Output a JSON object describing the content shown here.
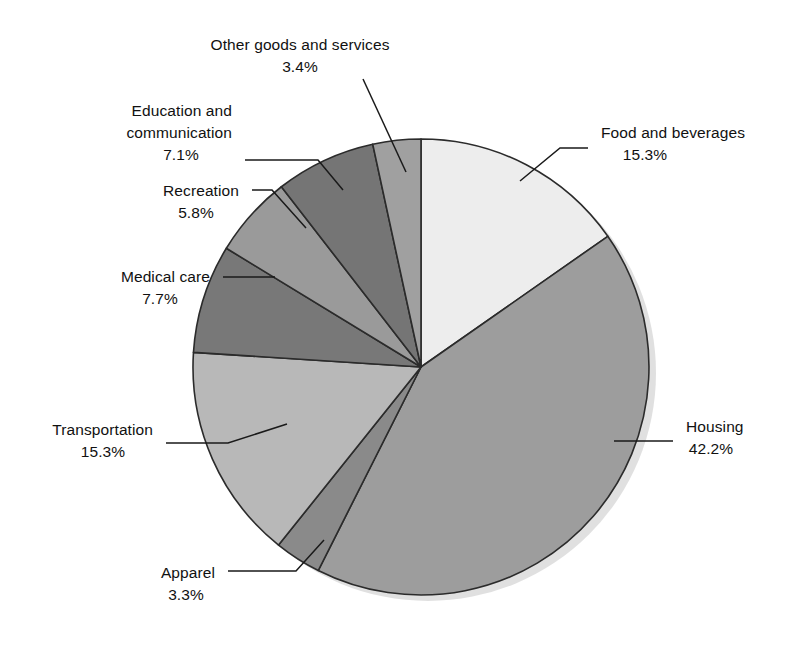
{
  "chart_data": {
    "type": "pie",
    "title": "",
    "subtitle": "",
    "xlabel": "",
    "ylabel": "",
    "legend_position": "none",
    "grid": false,
    "units": "percent",
    "start_angle_deg": 0,
    "direction": "clockwise",
    "categories": [
      "Food and beverages",
      "Housing",
      "Apparel",
      "Transportation",
      "Medical care",
      "Recreation",
      "Education and communication",
      "Other goods and services"
    ],
    "values": [
      15.3,
      42.2,
      3.3,
      15.3,
      7.7,
      5.8,
      7.1,
      3.4
    ],
    "value_labels": [
      "15.3%",
      "42.2%",
      "3.3%",
      "15.3%",
      "7.7%",
      "5.8%",
      "7.1%",
      "3.4%"
    ],
    "colors": [
      "#ededed",
      "#9d9d9d",
      "#8a8a8a",
      "#b8b8b8",
      "#787878",
      "#9a9a9a",
      "#757575",
      "#a0a0a0"
    ],
    "slices": [
      {
        "name": "Food and beverages",
        "label": "Food and beverages",
        "value": 15.3,
        "value_label": "15.3%",
        "color": "#ededed",
        "label_x": 601,
        "label_y": 138,
        "value_x": 645,
        "value_y": 160,
        "label_anchor": "start",
        "value_anchor": "middle",
        "leader": "M 520 181 L 560 148 L 588 148"
      },
      {
        "name": "Housing",
        "label": "Housing",
        "value": 42.2,
        "value_label": "42.2%",
        "color": "#9d9d9d",
        "label_x": 686,
        "label_y": 432,
        "value_x": 711,
        "value_y": 454,
        "label_anchor": "start",
        "value_anchor": "middle",
        "leader": "M 614 441 L 673 441"
      },
      {
        "name": "Apparel",
        "label": "Apparel",
        "value": 3.3,
        "value_label": "3.3%",
        "color": "#8a8a8a",
        "label_x": 215,
        "label_y": 578,
        "value_x": 186,
        "value_y": 600,
        "label_anchor": "end",
        "value_anchor": "middle",
        "leader": "M 324 540 L 296 571 L 228 571"
      },
      {
        "name": "Transportation",
        "label": "Transportation",
        "value": 15.3,
        "value_label": "15.3%",
        "color": "#b8b8b8",
        "label_x": 153,
        "label_y": 435,
        "value_x": 103,
        "value_y": 457,
        "label_anchor": "end",
        "value_anchor": "middle",
        "leader": "M 287 424 L 228 443 L 166 443"
      },
      {
        "name": "Medical care",
        "label": "Medical care",
        "value": 7.7,
        "value_label": "7.7%",
        "color": "#787878",
        "label_x": 210,
        "label_y": 282,
        "value_x": 160,
        "value_y": 304,
        "label_anchor": "end",
        "value_anchor": "middle",
        "leader": "M 275 277 L 223 277"
      },
      {
        "name": "Recreation",
        "label": "Recreation",
        "value": 5.8,
        "value_label": "5.8%",
        "color": "#9a9a9a",
        "label_x": 239,
        "label_y": 196,
        "value_x": 196,
        "value_y": 218,
        "label_anchor": "end",
        "value_anchor": "middle",
        "leader": "M 306 228 L 272 190 L 252 190"
      },
      {
        "name": "Education and communication",
        "label": "Education and",
        "label_line2": "communication",
        "value": 7.1,
        "value_label": "7.1%",
        "color": "#757575",
        "label_x": 232,
        "label_y": 116,
        "value_x": 181,
        "value_y": 160,
        "label_anchor": "end",
        "value_anchor": "middle",
        "leader": "M 343 190 L 318 160 L 245 160"
      },
      {
        "name": "Other goods and services",
        "label": "Other goods and services",
        "value": 3.4,
        "value_label": "3.4%",
        "color": "#a0a0a0",
        "label_x": 300,
        "label_y": 50,
        "value_x": 300,
        "value_y": 72,
        "label_anchor": "middle",
        "value_anchor": "middle",
        "leader": "M 406 172 L 363 79"
      }
    ],
    "geometry": {
      "center_x": 421,
      "center_y": 367,
      "radius": 228
    }
  }
}
